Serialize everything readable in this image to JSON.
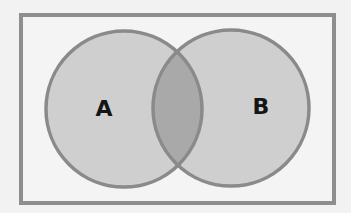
{
  "diagram": {
    "type": "venn",
    "universe": {
      "x": 21,
      "y": 15,
      "width": 313,
      "height": 188
    },
    "sets": [
      {
        "id": "A",
        "label": "A",
        "cx": 124,
        "cy": 109,
        "r": 78
      },
      {
        "id": "B",
        "label": "B",
        "cx": 231,
        "cy": 108,
        "r": 78
      }
    ],
    "intersection": {
      "sets": [
        "A",
        "B"
      ],
      "shaded": true
    }
  },
  "colors": {
    "background": "#f2f2f2",
    "universe_fill": "#f4f4f4",
    "border": "#8e8e8e",
    "circle_fill": "#cfcfcf",
    "intersection_fill": "#a9a9a9",
    "label": "#151515"
  }
}
